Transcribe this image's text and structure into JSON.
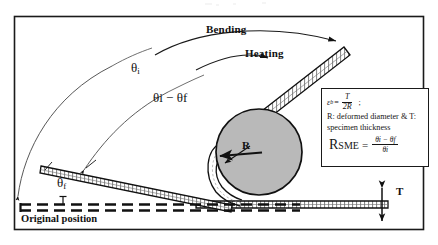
{
  "figure": {
    "type": "schematic-diagram",
    "canvas": {
      "width": 438,
      "height": 245
    },
    "border": {
      "color": "#1a1a1a",
      "x": 14,
      "y": 16,
      "width": 410,
      "height": 214
    }
  },
  "labels": {
    "bending": "Bending",
    "heating": "Heating",
    "theta_i": "θi",
    "theta_i_glyph": "θ",
    "theta_i_sub": "i",
    "theta_diff": "θi − θf",
    "theta_f": "θf",
    "theta_f_glyph": "θ",
    "theta_f_sub": "f",
    "radius": "R",
    "thickness": "T",
    "original_position": "Original position"
  },
  "formula_box": {
    "strain_symbol": "εb",
    "strain_symbol_base": "ε",
    "strain_symbol_sub": "b",
    "equals": "=",
    "strain_numerator": "T",
    "strain_denominator": "2R",
    "semicolon": ";",
    "definition_line1": "R: deformed diameter & T:",
    "definition_line2": "specimen thickness",
    "rsme_name": "R",
    "rsme_subscript": "SME",
    "rsme_equals": "=",
    "rsme_numerator": "θi − θf",
    "rsme_denominator": "θi"
  },
  "colors": {
    "ink": "#1a1a1a",
    "circle_fill": "#b9b9b9",
    "circle_stroke": "#111111",
    "strip_fill": "#ffffff",
    "strip_stroke": "#111111",
    "background": "#ffffff"
  },
  "geometry": {
    "mandrel_circle": {
      "cx": 259,
      "cy": 152,
      "r": 43
    },
    "radius_arrow": {
      "from_x": 259,
      "from_y": 152,
      "to_x": 220,
      "to_y": 157
    },
    "original_position_line_y": 207,
    "specimen_thickness_marker_x": 382
  }
}
